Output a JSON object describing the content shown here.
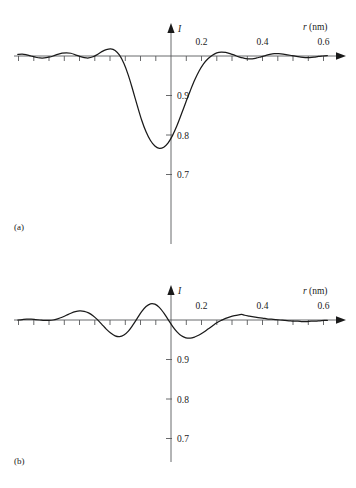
{
  "figure": {
    "title": "",
    "panels": [
      {
        "label": "(a)",
        "chart_index": 0
      },
      {
        "label": "(b)",
        "chart_index": 1
      }
    ]
  },
  "chart_data": [
    {
      "type": "line",
      "title": "",
      "panel_label": "(a)",
      "xlabel": "r (nm)",
      "ylabel": "I",
      "xlabel_italic_part": "r",
      "xlabel_unit": "(nm)",
      "xlim": [
        -0.36,
        0.72
      ],
      "ylim": [
        0.655,
        1.035
      ],
      "baseline_value": 1.0,
      "grid": false,
      "legend": null,
      "xticks": [
        -0.35,
        -0.3,
        -0.25,
        -0.2,
        -0.15,
        -0.1,
        -0.05,
        0.0,
        0.05,
        0.1,
        0.15,
        0.2,
        0.25,
        0.3,
        0.35,
        0.4,
        0.45,
        0.5,
        0.55,
        0.6,
        0.65
      ],
      "xticklabels": [
        "",
        "",
        "",
        "",
        "",
        "",
        "",
        "",
        "",
        "",
        "",
        "0.2",
        "",
        "",
        "",
        "0.4",
        "",
        "",
        "",
        "0.6",
        ""
      ],
      "yticks": [
        0.9,
        0.8,
        0.7
      ],
      "yticklabels": [
        "0.9",
        "0.8",
        "0.7"
      ],
      "x": [
        -0.36,
        -0.345,
        -0.33,
        -0.315,
        -0.3,
        -0.285,
        -0.27,
        -0.255,
        -0.24,
        -0.225,
        -0.21,
        -0.195,
        -0.18,
        -0.165,
        -0.15,
        -0.135,
        -0.12,
        -0.105,
        -0.09,
        -0.075,
        -0.06,
        -0.045,
        -0.03,
        -0.015,
        0.0,
        0.015,
        0.03,
        0.045,
        0.06,
        0.075,
        0.09,
        0.105,
        0.12,
        0.135,
        0.15,
        0.165,
        0.18,
        0.195,
        0.21,
        0.225,
        0.24,
        0.255,
        0.27,
        0.285,
        0.3,
        0.315,
        0.33,
        0.345,
        0.36,
        0.375,
        0.39,
        0.405,
        0.42,
        0.435,
        0.45,
        0.465,
        0.48,
        0.495,
        0.51,
        0.525,
        0.54,
        0.555,
        0.57,
        0.585,
        0.6,
        0.615,
        0.63,
        0.645,
        0.66,
        0.675,
        0.69
      ],
      "y": [
        1.004,
        1.005,
        1.003,
        1.0,
        0.997,
        0.995,
        0.995,
        0.997,
        1.0,
        1.004,
        1.007,
        1.008,
        1.007,
        1.003,
        0.999,
        0.996,
        0.995,
        0.998,
        1.004,
        1.011,
        1.016,
        1.018,
        1.014,
        1.002,
        0.981,
        0.951,
        0.914,
        0.875,
        0.838,
        0.808,
        0.786,
        0.772,
        0.766,
        0.769,
        0.78,
        0.799,
        0.824,
        0.853,
        0.883,
        0.912,
        0.939,
        0.962,
        0.98,
        0.993,
        1.002,
        1.008,
        1.01,
        1.009,
        1.006,
        1.002,
        0.998,
        0.995,
        0.993,
        0.993,
        0.995,
        0.998,
        1.001,
        1.004,
        1.006,
        1.006,
        1.005,
        1.003,
        1.001,
        0.999,
        0.997,
        0.996,
        0.996,
        0.997,
        0.999,
        1.0,
        1.001
      ],
      "notes": "Damped oscillatory intensity with a deep central minimum of about 0.766 at r = 0; baseline I = 1.0 coincides with the horizontal axis."
    },
    {
      "type": "line",
      "title": "",
      "panel_label": "(b)",
      "xlabel": "r (nm)",
      "ylabel": "I",
      "xlabel_italic_part": "r",
      "xlabel_unit": "(nm)",
      "xlim": [
        -0.36,
        0.72
      ],
      "ylim": [
        0.655,
        1.035
      ],
      "baseline_value": 1.0,
      "grid": false,
      "legend": null,
      "xticks": [
        -0.35,
        -0.3,
        -0.25,
        -0.2,
        -0.15,
        -0.1,
        -0.05,
        0.0,
        0.05,
        0.1,
        0.15,
        0.2,
        0.25,
        0.3,
        0.35,
        0.4,
        0.45,
        0.5,
        0.55,
        0.6,
        0.65
      ],
      "xticklabels": [
        "",
        "",
        "",
        "",
        "",
        "",
        "",
        "",
        "",
        "",
        "",
        "0.2",
        "",
        "",
        "",
        "0.4",
        "",
        "",
        "",
        "0.6",
        ""
      ],
      "yticks": [
        0.9,
        0.8,
        0.7
      ],
      "yticklabels": [
        "0.9",
        "0.8",
        "0.7"
      ],
      "x": [
        -0.36,
        -0.345,
        -0.33,
        -0.315,
        -0.3,
        -0.285,
        -0.27,
        -0.255,
        -0.24,
        -0.225,
        -0.21,
        -0.195,
        -0.18,
        -0.165,
        -0.15,
        -0.135,
        -0.12,
        -0.105,
        -0.09,
        -0.075,
        -0.06,
        -0.045,
        -0.03,
        -0.015,
        0.0,
        0.015,
        0.03,
        0.045,
        0.06,
        0.075,
        0.09,
        0.105,
        0.12,
        0.135,
        0.15,
        0.165,
        0.18,
        0.195,
        0.21,
        0.225,
        0.24,
        0.255,
        0.27,
        0.285,
        0.3,
        0.315,
        0.33,
        0.345,
        0.36,
        0.375,
        0.39,
        0.4,
        0.41,
        0.425,
        0.44,
        0.455,
        0.47,
        0.485,
        0.5,
        0.515,
        0.53,
        0.545,
        0.56,
        0.575,
        0.59,
        0.605,
        0.62,
        0.635,
        0.65,
        0.665,
        0.68,
        0.69
      ],
      "y": [
        1.0,
        1.001,
        1.002,
        1.002,
        1.001,
        1.0,
        0.999,
        0.999,
        1.0,
        1.003,
        1.007,
        1.012,
        1.017,
        1.021,
        1.023,
        1.022,
        1.018,
        1.011,
        1.001,
        0.989,
        0.977,
        0.967,
        0.96,
        0.958,
        0.962,
        0.972,
        0.987,
        1.004,
        1.021,
        1.034,
        1.041,
        1.04,
        1.032,
        1.018,
        1.001,
        0.984,
        0.97,
        0.96,
        0.955,
        0.954,
        0.957,
        0.962,
        0.969,
        0.977,
        0.985,
        0.993,
        0.999,
        1.004,
        1.008,
        1.011,
        1.013,
        1.014,
        1.012,
        1.01,
        1.008,
        1.006,
        1.005,
        1.003,
        1.002,
        1.001,
        1.0,
        0.999,
        0.998,
        0.997,
        0.997,
        0.996,
        0.996,
        0.997,
        0.997,
        0.998,
        0.999,
        0.999
      ],
      "notes": "Damped oscillation with a central maximum of about 1.041 just right of r = 0 and a small cusp-like peak near r = 0.40 nm; baseline I = 1.0 coincides with the horizontal axis."
    }
  ]
}
